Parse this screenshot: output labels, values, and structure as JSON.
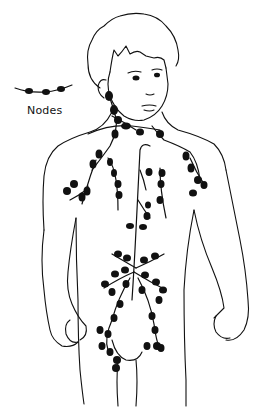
{
  "diagram": {
    "legend": {
      "label": "Nodes",
      "symbol": "chain of dark oval nodes on a line"
    },
    "colors": {
      "background": "#ffffff",
      "line": "#111111",
      "node": "#111111"
    },
    "regions": [
      {
        "name": "cervical",
        "location": "neck"
      },
      {
        "name": "axillary-left",
        "location": "left armpit"
      },
      {
        "name": "axillary-right",
        "location": "right armpit"
      },
      {
        "name": "thoracic",
        "location": "chest"
      },
      {
        "name": "abdominal",
        "location": "abdomen"
      },
      {
        "name": "inguinal",
        "location": "groin"
      }
    ]
  }
}
